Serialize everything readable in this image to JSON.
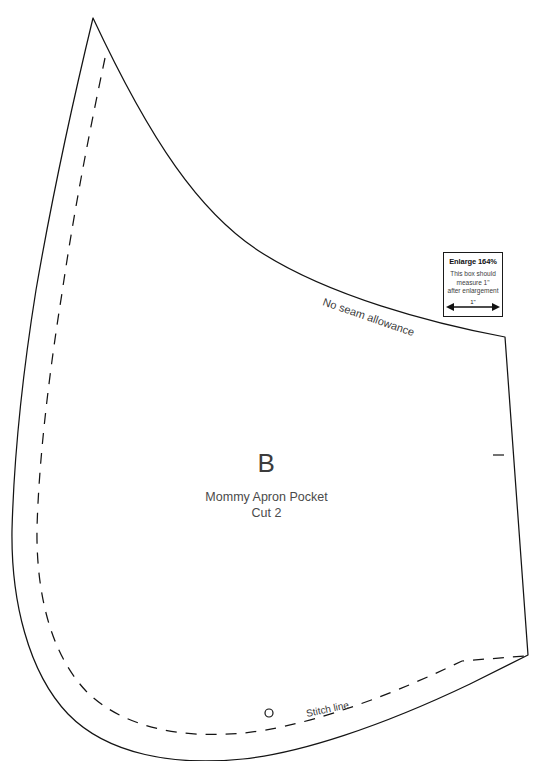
{
  "sheet": {
    "title": "Mommy Apron Pocket pattern piece B",
    "background_color": "#ffffff",
    "line_color": "#141414"
  },
  "piece": {
    "letter": "B",
    "name": "Mommy Apron Pocket",
    "cut_instruction": "Cut 2"
  },
  "annotations": {
    "seam_allowance_label": "No seam allowance",
    "stitch_line_label": "Stitch line"
  },
  "enlarge_box": {
    "title": "Enlarge 164%",
    "note_line_1": "This box should",
    "note_line_2": "measure 1\"",
    "note_line_3": "after enlargement",
    "arrow_caption": "1\"",
    "border_color": "#1a1a1a"
  },
  "markings": {
    "notch_label": "notch-mark",
    "drill_hole_label": "drill-hole"
  }
}
